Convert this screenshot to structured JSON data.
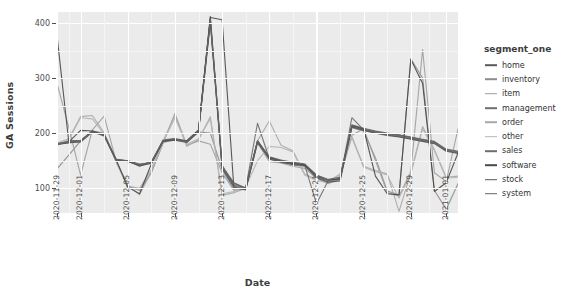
{
  "chart_data": {
    "type": "line",
    "title": "",
    "xlabel": "Date",
    "ylabel": "GA Sessions",
    "legend_title": "segment_one",
    "legend_position": "right",
    "grid": true,
    "ylim": [
      55,
      420
    ],
    "yticks": [
      100,
      200,
      300,
      400
    ],
    "xticks": [
      "2020-11-29",
      "2020-12-01",
      "2020-12-05",
      "2020-12-09",
      "2020-12-13",
      "2020-12-17",
      "2020-12-21",
      "2020-12-25",
      "2020-12-29",
      "2021-01-01"
    ],
    "x": [
      "2020-11-29",
      "2020-11-30",
      "2020-12-01",
      "2020-12-02",
      "2020-12-03",
      "2020-12-04",
      "2020-12-05",
      "2020-12-06",
      "2020-12-07",
      "2020-12-08",
      "2020-12-09",
      "2020-12-10",
      "2020-12-11",
      "2020-12-12",
      "2020-12-13",
      "2020-12-14",
      "2020-12-15",
      "2020-12-16",
      "2020-12-17",
      "2020-12-18",
      "2020-12-19",
      "2020-12-20",
      "2020-12-21",
      "2020-12-22",
      "2020-12-23",
      "2020-12-24",
      "2020-12-25",
      "2020-12-26",
      "2020-12-27",
      "2020-12-28",
      "2020-12-29",
      "2020-12-30",
      "2020-12-31",
      "2021-01-01",
      "2021-01-02"
    ],
    "series": [
      {
        "name": "home",
        "color": "#5a5a5a",
        "values": [
          180,
          182,
          185,
          203,
          197,
          152,
          150,
          140,
          147,
          186,
          188,
          186,
          204,
          412,
          140,
          110,
          100,
          186,
          156,
          148,
          146,
          143,
          122,
          112,
          118,
          213,
          207,
          203,
          199,
          196,
          192,
          188,
          184,
          168,
          165
        ]
      },
      {
        "name": "inventory",
        "color": "#8c8c8c",
        "values": [
          135,
          160,
          186,
          204,
          200,
          148,
          104,
          96,
          128,
          183,
          188,
          186,
          202,
          200,
          134,
          98,
          101,
          186,
          152,
          149,
          142,
          140,
          120,
          110,
          115,
          210,
          204,
          155,
          95,
          88,
          335,
          300,
          96,
          62,
          108
        ]
      },
      {
        "name": "item",
        "color": "#9e9e9e",
        "values": [
          291,
          210,
          124,
          206,
          231,
          150,
          106,
          88,
          130,
          182,
          236,
          178,
          186,
          180,
          128,
          96,
          98,
          182,
          148,
          146,
          140,
          136,
          118,
          108,
          120,
          196,
          208,
          150,
          92,
          86,
          130,
          352,
          128,
          112,
          208
        ]
      },
      {
        "name": "management",
        "color": "#707070",
        "values": [
          180,
          186,
          187,
          204,
          196,
          152,
          150,
          144,
          146,
          188,
          190,
          184,
          203,
          408,
          142,
          104,
          99,
          184,
          155,
          150,
          144,
          142,
          121,
          113,
          119,
          212,
          206,
          201,
          197,
          194,
          190,
          186,
          182,
          170,
          166
        ]
      },
      {
        "name": "order",
        "color": "#a8a8a8",
        "values": [
          182,
          190,
          230,
          232,
          200,
          152,
          104,
          100,
          134,
          186,
          232,
          176,
          188,
          230,
          87,
          92,
          100,
          186,
          222,
          178,
          168,
          126,
          116,
          112,
          126,
          194,
          140,
          132,
          126,
          58,
          128,
          212,
          170,
          120,
          122
        ]
      },
      {
        "name": "other",
        "color": "#b4b4b4",
        "values": [
          178,
          188,
          228,
          226,
          198,
          150,
          100,
          98,
          132,
          184,
          228,
          180,
          190,
          226,
          90,
          94,
          102,
          150,
          176,
          174,
          166,
          124,
          114,
          110,
          124,
          192,
          138,
          130,
          124,
          82,
          126,
          208,
          168,
          118,
          120
        ]
      },
      {
        "name": "sales",
        "color": "#6e6e6e",
        "values": [
          181,
          184,
          186,
          204,
          198,
          153,
          148,
          142,
          148,
          186,
          190,
          186,
          205,
          404,
          138,
          106,
          100,
          218,
          154,
          148,
          146,
          142,
          72,
          114,
          116,
          228,
          206,
          202,
          198,
          195,
          191,
          187,
          183,
          169,
          164
        ]
      },
      {
        "name": "software",
        "color": "#4a4a4a",
        "values": [
          377,
          184,
          205,
          204,
          196,
          152,
          102,
          90,
          144,
          186,
          188,
          186,
          206,
          410,
          406,
          100,
          98,
          186,
          156,
          150,
          145,
          143,
          123,
          115,
          117,
          214,
          208,
          122,
          90,
          88,
          334,
          290,
          94,
          110,
          164
        ]
      },
      {
        "name": "stock",
        "color": "#555555",
        "values": [
          179,
          183,
          184,
          202,
          195,
          151,
          149,
          141,
          145,
          185,
          187,
          183,
          202,
          400,
          136,
          102,
          97,
          183,
          153,
          147,
          143,
          141,
          119,
          111,
          113,
          211,
          205,
          200,
          196,
          193,
          189,
          185,
          181,
          167,
          163
        ]
      },
      {
        "name": "system",
        "color": "#636363",
        "values": [
          180,
          185,
          186,
          203,
          197,
          152,
          150,
          143,
          147,
          187,
          189,
          185,
          204,
          406,
          139,
          108,
          101,
          185,
          157,
          151,
          147,
          144,
          124,
          116,
          120,
          215,
          209,
          204,
          200,
          197,
          193,
          189,
          185,
          171,
          167
        ]
      }
    ]
  }
}
